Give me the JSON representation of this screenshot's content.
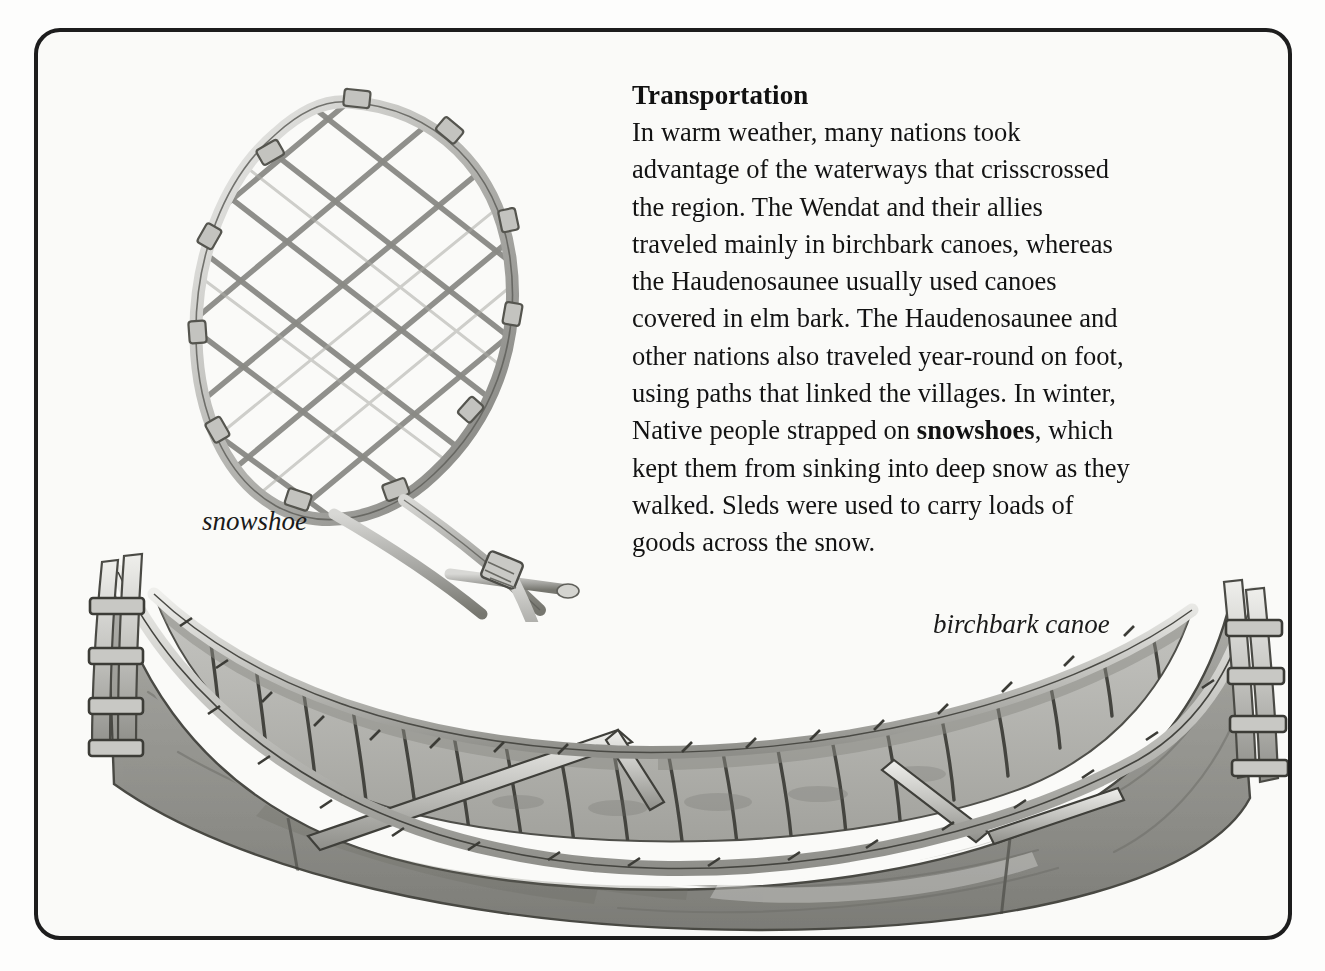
{
  "page": {
    "background_color": "#fdfdfc",
    "top_sliver_left": "",
    "top_sliver_right": ""
  },
  "feature_box": {
    "border_color": "#1d1d1d",
    "background_color": "#fafaf8",
    "corner_radius_px": 26
  },
  "text": {
    "heading": "Transportation",
    "paragraph_before_bold": "In warm weather, many nations took advantage of the waterways that crisscrossed the region. The Wendat and their allies traveled mainly in birchbark canoes, whereas the Haudenosaunee usually used canoes covered in elm bark. The Haudenosaunee and other nations also traveled year-round on foot, using paths that linked the villages. In winter, Native people strapped on ",
    "bold_term": "snowshoes",
    "paragraph_after_bold": ", which kept them from sinking into deep snow as they walked. Sleds were used to carry loads of goods across the snow.",
    "full_paragraph": "In warm weather, many nations took advantage of the waterways that crisscrossed the region. The Wendat and their allies traveled mainly in birchbark canoes, whereas the Haudenosaunee usually used canoes covered in elm bark. The Haudenosaunee and other nations also traveled year-round on foot, using paths that linked the villages. In winter, Native people strapped on snowshoes, which kept them from sinking into deep snow as they walked. Sleds were used to carry loads of goods across the snow.",
    "heading_color": "#111111",
    "body_color": "#131313"
  },
  "captions": {
    "snowshoe": "snowshoe",
    "canoe": "birchbark canoe"
  },
  "illustrations": {
    "snowshoe": {
      "name": "snowshoe-illustration",
      "description": "pencil drawing of a teardrop-shaped wooden snowshoe frame with rawhide lattice webbing and a long tail with crossbar"
    },
    "canoe": {
      "name": "birchbark-canoe-illustration",
      "description": "pencil drawing of a birchbark canoe in three-quarter view showing ribs, thwarts, gunwales and upswept ends"
    }
  },
  "colors": {
    "ink_dark": "#2a2a2a",
    "ink_mid": "#6e6e6e",
    "wash_light": "#c9c9c6",
    "wash_mid": "#9a9a96",
    "wash_dark": "#7d7d79"
  }
}
